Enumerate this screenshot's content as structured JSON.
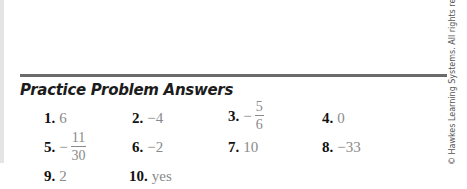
{
  "section": {
    "heading": "Practice Problem Answers"
  },
  "answers": [
    {
      "number": "1.",
      "value": "6"
    },
    {
      "number": "2.",
      "value": "−4"
    },
    {
      "number": "3.",
      "sign": "−",
      "numerator": "5",
      "denominator": "6"
    },
    {
      "number": "4.",
      "value": "0"
    },
    {
      "number": "5.",
      "sign": "−",
      "numerator": "11",
      "denominator": "30"
    },
    {
      "number": "6.",
      "value": "−2"
    },
    {
      "number": "7.",
      "value": "10"
    },
    {
      "number": "8.",
      "value": "−33"
    },
    {
      "number": "9.",
      "value": "2"
    },
    {
      "number": "10.",
      "value": "yes"
    }
  ],
  "footer": {
    "copyright": "© Hawkes Learning Systems. All rights reserved."
  }
}
